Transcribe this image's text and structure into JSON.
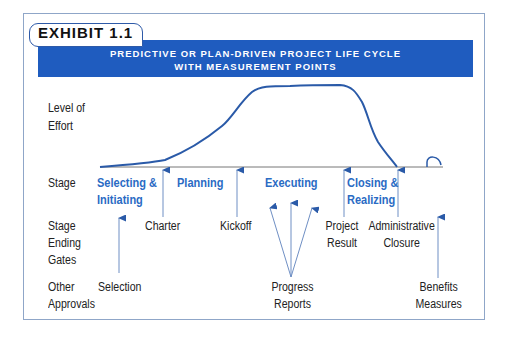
{
  "exhibit": {
    "label": "EXHIBIT 1.1",
    "title_line1": "PREDICTIVE OR PLAN-DRIVEN PROJECT LIFE CYCLE",
    "title_line2": "WITH MEASUREMENT POINTS"
  },
  "row_labels": {
    "effort_line1": "Level of",
    "effort_line2": "Effort",
    "stage": "Stage",
    "gates_line1": "Stage",
    "gates_line2": "Ending",
    "gates_line3": "Gates",
    "approvals_line1": "Other",
    "approvals_line2": "Approvals"
  },
  "stages": [
    {
      "line1": "Selecting &",
      "line2": "Initiating"
    },
    {
      "line1": "Planning"
    },
    {
      "line1": "Executing"
    },
    {
      "line1": "Closing &",
      "line2": "Realizing"
    }
  ],
  "gates": [
    {
      "line1": "Charter"
    },
    {
      "line1": "Kickoff"
    },
    {
      "line1": "Project",
      "line2": "Result"
    },
    {
      "line1": "Administrative",
      "line2": "Closure"
    }
  ],
  "approvals": [
    {
      "line1": "Selection"
    },
    {
      "line1": "Progress",
      "line2": "Reports"
    },
    {
      "line1": "Benefits",
      "line2": "Measures"
    }
  ],
  "colors": {
    "banner": "#1f5cbf",
    "stage_text": "#2a6bc4",
    "curve": "#2a5aa8",
    "arrow": "#2a5aa8",
    "axis": "#777777",
    "frame": "#8fa6c8"
  }
}
